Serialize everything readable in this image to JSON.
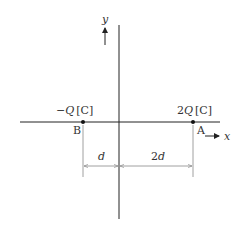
{
  "diagram": {
    "axes": {
      "x_label": "x",
      "y_label": "y"
    },
    "charges": [
      {
        "point": "B",
        "charge_sign": "−",
        "charge_symbol": "Q",
        "unit": "[C]"
      },
      {
        "point": "A",
        "charge_coeff": "2",
        "charge_symbol": "Q",
        "unit": "[C]"
      }
    ],
    "dimensions": [
      {
        "label": "d"
      },
      {
        "label_coeff": "2",
        "label_var": "d"
      }
    ],
    "colors": {
      "axis": "#222222",
      "dimension": "#888888",
      "text": "#333333",
      "point": "#111111"
    }
  }
}
